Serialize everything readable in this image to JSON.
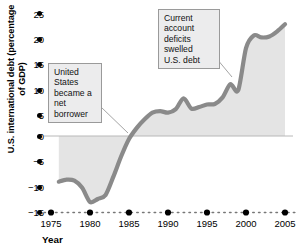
{
  "chart_data": {
    "type": "area",
    "title": "",
    "xlabel": "Year",
    "ylabel": "U.S. international debt (percentage of GDP)",
    "xlim": [
      1975,
      2005
    ],
    "ylim": [
      -15,
      25
    ],
    "grid": false,
    "legend": "none",
    "y_ticks": [
      25,
      20,
      15,
      10,
      5,
      0,
      -5,
      -10,
      -15
    ],
    "y_tick_labels": [
      "25",
      "20",
      "15",
      "10",
      "5",
      "0",
      "−5",
      "−10",
      "−15"
    ],
    "x_ticks": [
      1975,
      1980,
      1985,
      1990,
      1995,
      2000,
      2005
    ],
    "x_tick_labels": [
      "1975",
      "1980",
      "1985",
      "1990",
      "1995",
      "2000",
      "2005"
    ],
    "series": [
      {
        "name": "U.S. international debt (percentage of GDP)",
        "x": [
          1976,
          1977,
          1978,
          1979,
          1980,
          1981,
          1982,
          1983,
          1984,
          1985,
          1986,
          1987,
          1988,
          1989,
          1990,
          1991,
          1992,
          1993,
          1994,
          1995,
          1996,
          1997,
          1998,
          1999,
          2000,
          2001,
          2002,
          2003,
          2004,
          2005
        ],
        "values": [
          -9.0,
          -8.6,
          -8.8,
          -10.2,
          -13.0,
          -12.4,
          -11.6,
          -8.0,
          -4.0,
          -0.6,
          1.6,
          3.3,
          4.6,
          4.9,
          4.6,
          5.3,
          7.4,
          5.4,
          5.7,
          6.2,
          6.3,
          7.6,
          10.2,
          9.0,
          17.3,
          19.8,
          19.4,
          19.6,
          20.6,
          22.0
        ]
      }
    ],
    "annotations": [
      {
        "id": "annotation-net-borrower",
        "text": "United States became a net borrower",
        "lines": [
          "United States",
          "became a",
          "net borrower"
        ],
        "points_to_year": 1985,
        "points_to_value": 0
      },
      {
        "id": "annotation-current-account",
        "text": "Current account deficits swelled U.S. debt",
        "lines": [
          "Current account",
          "deficits swelled",
          "U.S. debt"
        ],
        "points_to_year": 1999,
        "points_to_value": 9
      }
    ],
    "colors": {
      "line": "#8a8a8a",
      "fill": "#e4e4e4",
      "axis": "#000000",
      "annotation_box_fill": "#ececed",
      "annotation_box_border": "#9a9a9a",
      "leader_line": "#9a9a9a",
      "background": "#ffffff"
    }
  }
}
